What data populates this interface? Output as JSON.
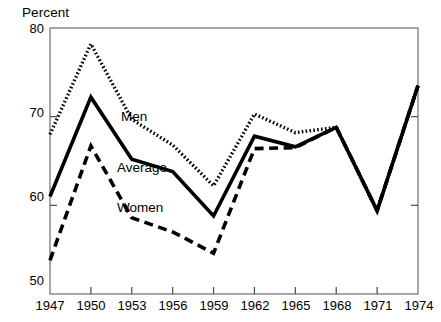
{
  "chart_data": {
    "type": "line",
    "title": "",
    "subtitle": "",
    "ylabel": "Percent",
    "xlabel": "",
    "x": [
      1947,
      1950,
      1953,
      1956,
      1959,
      1962,
      1965,
      1968,
      1971,
      1974
    ],
    "xtick_labels": [
      "1947",
      "1950",
      "1953",
      "1956",
      "1959",
      "1962",
      "1965",
      "1968",
      "1971",
      "1974"
    ],
    "ytick_labels": [
      "80",
      "70",
      "60",
      "50"
    ],
    "ytick_values": [
      80,
      70,
      60,
      50
    ],
    "xlim": [
      1947,
      1974
    ],
    "ylim": [
      50,
      80
    ],
    "grid": false,
    "legend_position": "inline-annotations",
    "series": [
      {
        "name": "Men",
        "style": "dotted",
        "color": "#000000",
        "values": [
          68.0,
          78.2,
          69.7,
          66.8,
          62.2,
          70.3,
          68.2,
          68.8,
          59.4,
          73.5
        ]
      },
      {
        "name": "Average",
        "style": "solid",
        "color": "#000000",
        "values": [
          61.0,
          72.2,
          65.2,
          63.8,
          58.8,
          67.8,
          66.6,
          68.8,
          59.4,
          73.5
        ]
      },
      {
        "name": "Women",
        "style": "dashed",
        "color": "#000000",
        "values": [
          53.8,
          66.7,
          58.6,
          57.0,
          54.6,
          66.4,
          66.5,
          68.8,
          59.4,
          73.5
        ]
      }
    ],
    "annotations": [
      {
        "text": "Men",
        "x": 1955.2,
        "y": 70.8
      },
      {
        "text": "Average",
        "x": 1955.1,
        "y": 64.5
      },
      {
        "text": "Women",
        "x": 1955.1,
        "y": 58.5
      }
    ]
  },
  "axis": {
    "ylabel": "Percent",
    "yticks": [
      "80",
      "70",
      "60",
      "50"
    ],
    "xticks": [
      "1947",
      "1950",
      "1953",
      "1956",
      "1959",
      "1962",
      "1965",
      "1968",
      "1971",
      "1974"
    ]
  },
  "labels": {
    "men": "Men",
    "average": "Average",
    "women": "Women"
  }
}
